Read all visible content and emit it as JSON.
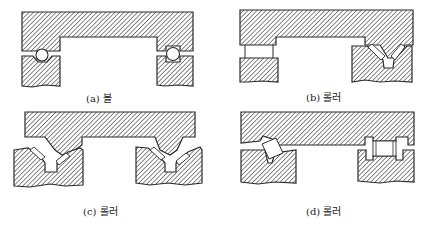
{
  "figure": {
    "panels": [
      {
        "id": "a",
        "label": "(a) 볼",
        "element_type": "ball"
      },
      {
        "id": "b",
        "label": "(b) 롤러",
        "element_type": "roller"
      },
      {
        "id": "c",
        "label": "(c) 롤러",
        "element_type": "roller"
      },
      {
        "id": "d",
        "label": "(d) 롤러",
        "element_type": "roller"
      }
    ],
    "colors": {
      "background": "#ffffff",
      "outline": "#2a2a2a",
      "hatch": "#3a3a3a",
      "element_fill": "#ffffff"
    }
  }
}
